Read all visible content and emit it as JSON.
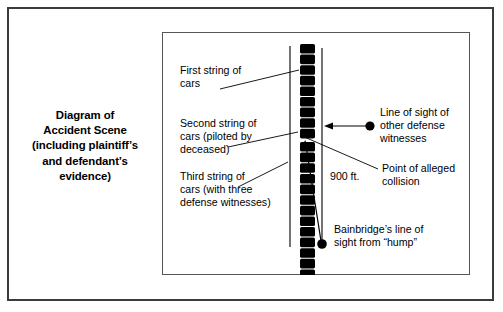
{
  "figure": {
    "caption_lines": [
      "Diagram of",
      "Accident Scene",
      "(including plaintiff’s",
      "and defendant’s",
      "evidence)"
    ],
    "background_color": "#ffffff",
    "ink_color": "#000000",
    "outer_frame_color": "#3b3b3b",
    "inner_frame_color": "#555555"
  },
  "annotations": {
    "first_string": {
      "lines": [
        "First string of",
        "cars"
      ],
      "side": "left"
    },
    "second_string": {
      "lines": [
        "Second string of",
        "cars (piloted by",
        "deceased)"
      ],
      "side": "left"
    },
    "third_string": {
      "lines": [
        "Third string of",
        "cars (with three",
        "defense witnesses)"
      ],
      "side": "left"
    },
    "distance": {
      "lines": [
        "900 ft."
      ],
      "side": "center"
    },
    "other_witnesses": {
      "lines": [
        "Line of sight of",
        "other defense",
        "witnesses"
      ],
      "side": "right"
    },
    "collision_point": {
      "lines": [
        "Point of alleged",
        "collision"
      ],
      "side": "right"
    },
    "bainbridge": {
      "lines": [
        "Bainbridge’s line of",
        "sight from “hump”"
      ],
      "side": "right"
    }
  },
  "scene": {
    "rails": [
      {
        "name": "left-rail",
        "x": 128,
        "y1": 14,
        "y2": 215
      },
      {
        "name": "right-rail",
        "x": 160,
        "y1": 16,
        "y2": 215
      }
    ],
    "car_strings": [
      {
        "name": "first-string-of-cars",
        "count": 9,
        "top": 12,
        "car_height": 9.6,
        "gap": 1.0
      },
      {
        "name": "second-string-of-cars",
        "count": 3,
        "top": 110,
        "car_height": 9.6,
        "gap": 1.0
      },
      {
        "name": "third-string-of-cars",
        "count": 12,
        "top": 142,
        "car_height": 9.6,
        "gap": 1.0
      }
    ],
    "car_x": 138,
    "car_width": 15,
    "markers": [
      {
        "name": "other-defense-witnesses-eye",
        "x": 206,
        "y": 94,
        "r": 4.6
      },
      {
        "name": "bainbridge-eye",
        "x": 160,
        "y": 213,
        "r": 4.6
      }
    ],
    "arrows": [
      {
        "name": "other-witnesses-sight-arrow",
        "from_x": 204,
        "from_y": 94,
        "to_x": 163,
        "to_y": 94
      },
      {
        "name": "bainbridge-sight-arrow",
        "from_x": 159,
        "from_y": 211,
        "to_x": 143,
        "to_y": 127
      }
    ]
  }
}
